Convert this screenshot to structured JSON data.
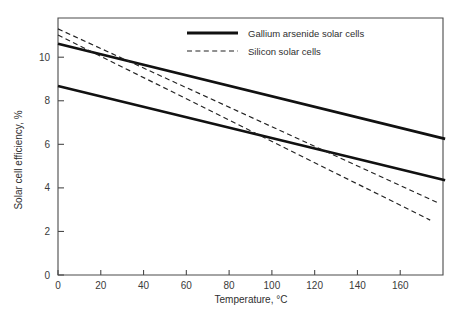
{
  "chart_data": {
    "type": "line",
    "title": "",
    "xlabel": "Temperature, °C",
    "ylabel": "Solar cell efficiency, %",
    "xlim": [
      0,
      180
    ],
    "ylim": [
      0,
      11.8
    ],
    "xticks": [
      0,
      20,
      40,
      60,
      80,
      100,
      120,
      140,
      160
    ],
    "yticks": [
      0,
      2,
      4,
      6,
      8,
      10
    ],
    "xtick_labels": [
      "0",
      "20",
      "40",
      "60",
      "80",
      "100",
      "120",
      "140",
      "160"
    ],
    "ytick_labels": [
      "0",
      "2",
      "4",
      "6",
      "8",
      "10"
    ],
    "grid": false,
    "legend_position": "top-right",
    "legend": [
      {
        "label": "Gallium arsenide solar cells",
        "style": "solid"
      },
      {
        "label": "Silicon solar cells",
        "style": "dashed"
      }
    ],
    "series": [
      {
        "name": "Gallium arsenide solar cells (upper)",
        "style": "solid",
        "x": [
          0,
          181
        ],
        "y": [
          10.62,
          6.25
        ]
      },
      {
        "name": "Gallium arsenide solar cells (lower)",
        "style": "solid",
        "x": [
          0,
          181
        ],
        "y": [
          8.68,
          4.35
        ]
      },
      {
        "name": "Silicon solar cells (upper)",
        "style": "dashed",
        "x": [
          0,
          178
        ],
        "y": [
          11.3,
          3.3
        ]
      },
      {
        "name": "Silicon solar cells (lower)",
        "style": "dashed",
        "x": [
          0,
          174
        ],
        "y": [
          11.02,
          2.52
        ]
      }
    ]
  }
}
